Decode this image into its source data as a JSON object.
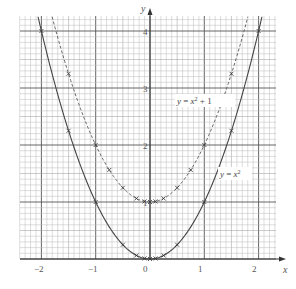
{
  "chart_data": {
    "type": "line",
    "title": "",
    "xlabel": "x",
    "ylabel": "y",
    "xlim": [
      -2.4,
      2.3
    ],
    "ylim": [
      0,
      4.25
    ],
    "grid": true,
    "grid_minor_step": 0.1,
    "grid_major_step": 1,
    "x_ticks": [
      "-2",
      "-1",
      "0",
      "1",
      "2"
    ],
    "x_tick_values": [
      -2,
      -1,
      0,
      1,
      2
    ],
    "y_ticks": [
      "1",
      "2",
      "3",
      "4"
    ],
    "y_tick_values": [
      1,
      2,
      3,
      4
    ],
    "series": [
      {
        "name": "y = x²",
        "label": "y = x²",
        "style": "solid",
        "marker": "x",
        "color": "#444444",
        "x": [
          -2,
          -1.5,
          -1,
          -0.5,
          -0.25,
          -0.1,
          0,
          0.1,
          0.25,
          0.5,
          1,
          1.5,
          2
        ],
        "values": [
          4,
          2.25,
          1,
          0.25,
          0.0625,
          0.01,
          0,
          0.01,
          0.0625,
          0.25,
          1,
          2.25,
          4
        ]
      },
      {
        "name": "y = x² + 1",
        "label": "y = x² + 1",
        "style": "dashed",
        "marker": "x",
        "color": "#666666",
        "x": [
          -1.5,
          -1,
          -0.75,
          -0.5,
          -0.25,
          -0.1,
          0,
          0.1,
          0.25,
          0.5,
          0.75,
          1,
          1.5
        ],
        "values": [
          3.25,
          2,
          1.5625,
          1.25,
          1.0625,
          1.01,
          1,
          1.01,
          1.0625,
          1.25,
          1.5625,
          2,
          3.25
        ]
      }
    ],
    "annotations": [
      {
        "text": "y = x² + 1",
        "x": 1.05,
        "y": 2.8
      },
      {
        "text": "y = x²",
        "x": 1.55,
        "y": 1.5
      }
    ]
  },
  "labels": {
    "x_axis": "x",
    "y_axis": "y",
    "curve1": "y = x²",
    "curve2": "y = x² + 1",
    "x_tick_0": "−2",
    "x_tick_1": "−1",
    "x_tick_2": "0",
    "x_tick_3": "1",
    "x_tick_4": "2",
    "y_tick_1": "1",
    "y_tick_2": "2",
    "y_tick_3": "3",
    "y_tick_4": "4"
  }
}
